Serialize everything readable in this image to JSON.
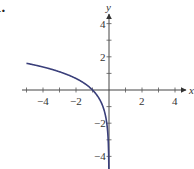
{
  "problem": {
    "number": "1."
  },
  "chart_data": {
    "type": "line",
    "title": "",
    "xlabel": "x",
    "ylabel": "y",
    "xlim": [
      -5,
      5
    ],
    "ylim": [
      -5,
      5
    ],
    "x_ticks": [
      -4,
      -2,
      2,
      4
    ],
    "y_ticks": [
      4,
      2,
      -2,
      -4
    ],
    "x_tick_labels": [
      "−4",
      "−2",
      "2",
      "4"
    ],
    "y_tick_labels": [
      "4",
      "2",
      "−2",
      "−4"
    ],
    "grid": false,
    "series": [
      {
        "name": "y = ln(−x)",
        "color": "#3a3f7a",
        "x": [
          -5,
          -4,
          -3,
          -2,
          -1,
          -0.5,
          -0.25,
          -0.1,
          -0.05,
          -0.02
        ],
        "y": [
          1.61,
          1.39,
          1.1,
          0.69,
          0,
          -0.69,
          -1.39,
          -2.3,
          -3.0,
          -3.91
        ]
      }
    ]
  }
}
